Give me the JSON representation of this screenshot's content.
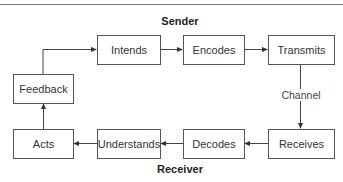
{
  "diagram": {
    "sender_heading": "Sender",
    "receiver_heading": "Receiver",
    "channel_label": "Channel",
    "nodes": {
      "intends": "Intends",
      "encodes": "Encodes",
      "transmits": "Transmits",
      "feedback": "Feedback",
      "acts": "Acts",
      "understands": "Understands",
      "decodes": "Decodes",
      "receives": "Receives"
    },
    "edges": [
      {
        "from": "feedback",
        "to": "intends"
      },
      {
        "from": "intends",
        "to": "encodes"
      },
      {
        "from": "encodes",
        "to": "transmits"
      },
      {
        "from": "transmits",
        "to": "receives",
        "label": "Channel"
      },
      {
        "from": "receives",
        "to": "decodes"
      },
      {
        "from": "decodes",
        "to": "understands"
      },
      {
        "from": "understands",
        "to": "acts"
      },
      {
        "from": "acts",
        "to": "feedback"
      }
    ]
  }
}
